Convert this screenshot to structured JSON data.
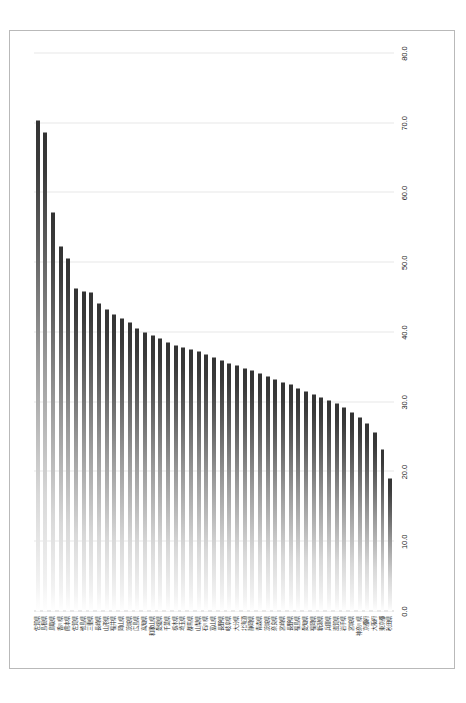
{
  "chart_data": {
    "type": "bar",
    "orientation": "vertical-rotated",
    "title": "",
    "subtitle": "",
    "xlabel": "",
    "ylabel": "",
    "ylim": [
      0.0,
      80.0
    ],
    "grid": true,
    "legend": null,
    "legend_position": "none",
    "tick_labels": [
      "0.0",
      "10.0",
      "20.0",
      "30.0",
      "40.0",
      "50.0",
      "60.0",
      "70.0",
      "80.0"
    ],
    "tick_values": [
      0,
      10,
      20,
      30,
      40,
      50,
      60,
      70,
      80
    ],
    "categories": [
      "佐賀県",
      "島根県",
      "鳥取県",
      "香川県",
      "熊本県",
      "佐賀県",
      "徳島県",
      "三重県",
      "長崎県",
      "山形県",
      "福井県",
      "岡山県",
      "茨城県",
      "広島県",
      "高知県",
      "和歌山県",
      "愛媛県",
      "千葉県",
      "栃木県",
      "埼玉県",
      "群馬県",
      "山梨県",
      "石川県",
      "富山県",
      "長野県",
      "岐阜県",
      "大分県",
      "北海道",
      "静岡県",
      "青森県",
      "茨城県",
      "奈良県",
      "宮崎県",
      "長野県",
      "福島県",
      "愛知県",
      "福岡県",
      "新潟県",
      "兵庫県",
      "滋賀県",
      "岩手県",
      "宮城県",
      "神奈川県",
      "京都府",
      "大阪府",
      "東京都",
      "秋田県"
    ],
    "values": [
      70.4,
      68.7,
      57.2,
      52.4,
      50.6,
      46.3,
      45.9,
      45.7,
      44.2,
      43.3,
      42.6,
      42.0,
      41.4,
      40.6,
      40.0,
      39.5,
      39.1,
      38.6,
      38.2,
      37.9,
      37.6,
      37.3,
      36.9,
      36.4,
      36.0,
      35.6,
      35.2,
      34.9,
      34.5,
      34.1,
      33.7,
      33.3,
      32.9,
      32.5,
      32.0,
      31.6,
      31.1,
      30.7,
      30.3,
      29.8,
      29.3,
      28.6,
      27.8,
      26.9,
      25.6,
      23.2,
      19.0
    ],
    "bar_color_dark": "#333333",
    "bar_color_light": "#ffffff",
    "gridline_color": "#e8e8e8"
  }
}
